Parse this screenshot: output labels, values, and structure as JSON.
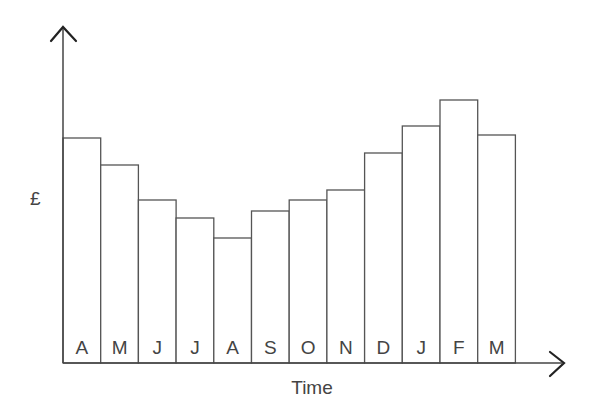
{
  "chart_data": {
    "type": "bar",
    "title": "",
    "xlabel": "Time",
    "ylabel": "£",
    "categories": [
      "A",
      "M",
      "J",
      "J",
      "A",
      "S",
      "O",
      "N",
      "D",
      "J",
      "F",
      "M"
    ],
    "values": [
      225,
      198,
      163,
      145,
      125,
      152,
      163,
      173,
      210,
      237,
      263,
      228
    ],
    "value_units": "relative (no scale shown)",
    "ylim": [
      0,
      300
    ],
    "grid": false,
    "legend": null,
    "bar_style": {
      "fill": "#ffffff",
      "stroke": "#555555"
    },
    "axis_arrows": true
  },
  "labels": {
    "x_axis": "Time",
    "y_axis": "£"
  }
}
